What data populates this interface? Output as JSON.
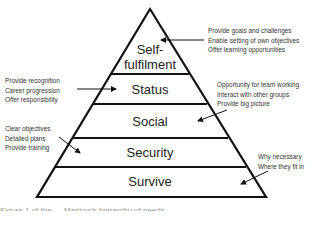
{
  "diagram": {
    "type": "pyramid",
    "levels": [
      {
        "label_lines": [
          "Self-",
          "fulfilment"
        ]
      },
      {
        "label": "Status"
      },
      {
        "label": "Social"
      },
      {
        "label": "Security"
      },
      {
        "label": "Survive"
      }
    ],
    "annotations": {
      "self_fulfilment": [
        "Provide goals and challenges",
        "Enable setting of own objectives",
        "Offer learning opportunities"
      ],
      "status": [
        "Provide recognition",
        "Career progression",
        "Offer responsibility"
      ],
      "social": [
        "Opportunity for team working",
        "Interact with other groups",
        "Provide big picture"
      ],
      "security": [
        "Clear objectives",
        "Detailed plans",
        "Provide training"
      ],
      "survive": [
        "Why necessary",
        "Where they fit in"
      ]
    },
    "caption": "Figure 1 of the … Maslow's hierarchy of needs"
  },
  "colors": {
    "line": "#111111",
    "text": "#222222",
    "background": "#ffffff"
  }
}
